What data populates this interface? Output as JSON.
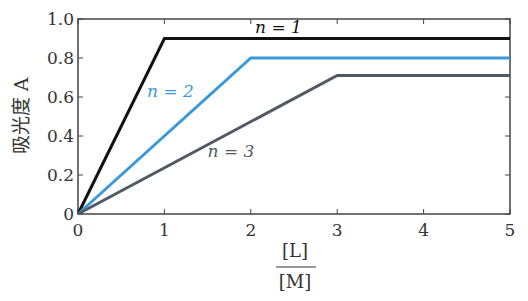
{
  "chart_data": {
    "type": "line",
    "title": "",
    "xlabel": "[L]/[M]",
    "xlabel_numerator": "[L]",
    "xlabel_denominator": "[M]",
    "ylabel": "吸光度 A",
    "xlim": [
      0,
      5
    ],
    "ylim": [
      0,
      1.0
    ],
    "xticks": [
      "0",
      "1",
      "2",
      "3",
      "4",
      "5"
    ],
    "yticks": [
      "0",
      "0.2",
      "0.4",
      "0.6",
      "0.8",
      "1.0"
    ],
    "grid": false,
    "legend": "inline annotations",
    "series": [
      {
        "name": "n = 1",
        "color": "#111111",
        "x": [
          0,
          1,
          5
        ],
        "y": [
          0,
          0.9,
          0.9
        ]
      },
      {
        "name": "n = 2",
        "color": "#3a9ad9",
        "x": [
          0,
          2,
          5
        ],
        "y": [
          0,
          0.8,
          0.8
        ]
      },
      {
        "name": "n = 3",
        "color": "#505a66",
        "x": [
          0,
          3,
          5
        ],
        "y": [
          0,
          0.71,
          0.71
        ]
      }
    ],
    "annotations": [
      {
        "text": "n = 1",
        "x": 2.05,
        "y": 0.93,
        "color": "#111111"
      },
      {
        "text": "n = 2",
        "x": 0.8,
        "y": 0.6,
        "color": "#3a9ad9"
      },
      {
        "text": "n = 3",
        "x": 1.5,
        "y": 0.29,
        "color": "#505a66"
      }
    ]
  }
}
